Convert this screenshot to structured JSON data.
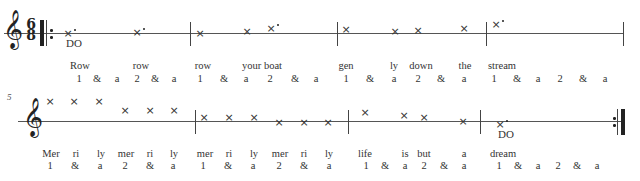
{
  "score": {
    "title": "Row, Row, Row Your Boat — rhythm/solfege notation",
    "time_signature": {
      "numerator": "6",
      "denominator": "8"
    },
    "clef": "treble-clef",
    "systems": [
      {
        "measure_start": "",
        "notes": [
          {
            "x": 68,
            "y": 33,
            "dotted": true,
            "solfege": "DO"
          },
          {
            "x": 137,
            "y": 32,
            "dotted": true
          },
          {
            "x": 200,
            "y": 33
          },
          {
            "x": 247,
            "y": 31
          },
          {
            "x": 271,
            "y": 28,
            "dotted": true
          },
          {
            "x": 346,
            "y": 29
          },
          {
            "x": 395,
            "y": 31
          },
          {
            "x": 418,
            "y": 30
          },
          {
            "x": 464,
            "y": 28
          },
          {
            "x": 496,
            "y": 24,
            "dotted": true
          }
        ],
        "lyrics": [
          {
            "x": 80,
            "text": "Row"
          },
          {
            "x": 141,
            "text": "row"
          },
          {
            "x": 203,
            "text": "row"
          },
          {
            "x": 262,
            "text": "your boat"
          },
          {
            "x": 346,
            "text": "gen"
          },
          {
            "x": 394,
            "text": "ly"
          },
          {
            "x": 421,
            "text": "down"
          },
          {
            "x": 465,
            "text": "the"
          },
          {
            "x": 502,
            "text": "stream"
          }
        ],
        "counts": [
          {
            "x": 79,
            "text": "1"
          },
          {
            "x": 97,
            "text": "&"
          },
          {
            "x": 117,
            "text": "a"
          },
          {
            "x": 137,
            "text": "2"
          },
          {
            "x": 155,
            "text": "&"
          },
          {
            "x": 174,
            "text": "a"
          },
          {
            "x": 200,
            "text": "1"
          },
          {
            "x": 224,
            "text": "&"
          },
          {
            "x": 246,
            "text": "a"
          },
          {
            "x": 270,
            "text": "2"
          },
          {
            "x": 295,
            "text": "&"
          },
          {
            "x": 316,
            "text": "a"
          },
          {
            "x": 346,
            "text": "1"
          },
          {
            "x": 370,
            "text": "&"
          },
          {
            "x": 394,
            "text": "a"
          },
          {
            "x": 418,
            "text": "2"
          },
          {
            "x": 441,
            "text": "&"
          },
          {
            "x": 464,
            "text": "a"
          },
          {
            "x": 494,
            "text": "1"
          },
          {
            "x": 517,
            "text": "&"
          },
          {
            "x": 538,
            "text": "a"
          },
          {
            "x": 560,
            "text": "2"
          },
          {
            "x": 583,
            "text": "&"
          },
          {
            "x": 605,
            "text": "a"
          }
        ]
      },
      {
        "measure_start": "5",
        "notes": [
          {
            "x": 50,
            "y": 101
          },
          {
            "x": 74,
            "y": 101
          },
          {
            "x": 99,
            "y": 101
          },
          {
            "x": 125,
            "y": 110
          },
          {
            "x": 150,
            "y": 110
          },
          {
            "x": 174,
            "y": 110
          },
          {
            "x": 204,
            "y": 117
          },
          {
            "x": 229,
            "y": 117
          },
          {
            "x": 254,
            "y": 117
          },
          {
            "x": 279,
            "y": 122
          },
          {
            "x": 304,
            "y": 122
          },
          {
            "x": 328,
            "y": 122
          },
          {
            "x": 365,
            "y": 112
          },
          {
            "x": 404,
            "y": 115
          },
          {
            "x": 424,
            "y": 117
          },
          {
            "x": 463,
            "y": 121
          },
          {
            "x": 500,
            "y": 124,
            "dotted": true,
            "solfege": "DO"
          }
        ],
        "lyrics": [
          {
            "x": 51,
            "text": "Mer"
          },
          {
            "x": 76,
            "text": "ri"
          },
          {
            "x": 101,
            "text": "ly"
          },
          {
            "x": 126,
            "text": "mer"
          },
          {
            "x": 150,
            "text": "ri"
          },
          {
            "x": 174,
            "text": "ly"
          },
          {
            "x": 205,
            "text": "mer"
          },
          {
            "x": 229,
            "text": "ri"
          },
          {
            "x": 254,
            "text": "ly"
          },
          {
            "x": 280,
            "text": "mer"
          },
          {
            "x": 304,
            "text": "ri"
          },
          {
            "x": 329,
            "text": "ly"
          },
          {
            "x": 365,
            "text": "life"
          },
          {
            "x": 405,
            "text": "is"
          },
          {
            "x": 424,
            "text": "but"
          },
          {
            "x": 464,
            "text": "a"
          },
          {
            "x": 503,
            "text": "dream"
          }
        ],
        "counts": [
          {
            "x": 50,
            "text": "1"
          },
          {
            "x": 75,
            "text": "&"
          },
          {
            "x": 100,
            "text": "a"
          },
          {
            "x": 125,
            "text": "2"
          },
          {
            "x": 150,
            "text": "&"
          },
          {
            "x": 173,
            "text": "a"
          },
          {
            "x": 203,
            "text": "1"
          },
          {
            "x": 228,
            "text": "&"
          },
          {
            "x": 253,
            "text": "a"
          },
          {
            "x": 279,
            "text": "2"
          },
          {
            "x": 304,
            "text": "&"
          },
          {
            "x": 329,
            "text": "a"
          },
          {
            "x": 366,
            "text": "1"
          },
          {
            "x": 385,
            "text": "&"
          },
          {
            "x": 405,
            "text": "a"
          },
          {
            "x": 424,
            "text": "2"
          },
          {
            "x": 444,
            "text": "&"
          },
          {
            "x": 464,
            "text": "a"
          },
          {
            "x": 499,
            "text": "1"
          },
          {
            "x": 518,
            "text": "&"
          },
          {
            "x": 538,
            "text": "a"
          },
          {
            "x": 558,
            "text": "2"
          },
          {
            "x": 577,
            "text": "&"
          },
          {
            "x": 597,
            "text": "a"
          }
        ]
      }
    ]
  }
}
